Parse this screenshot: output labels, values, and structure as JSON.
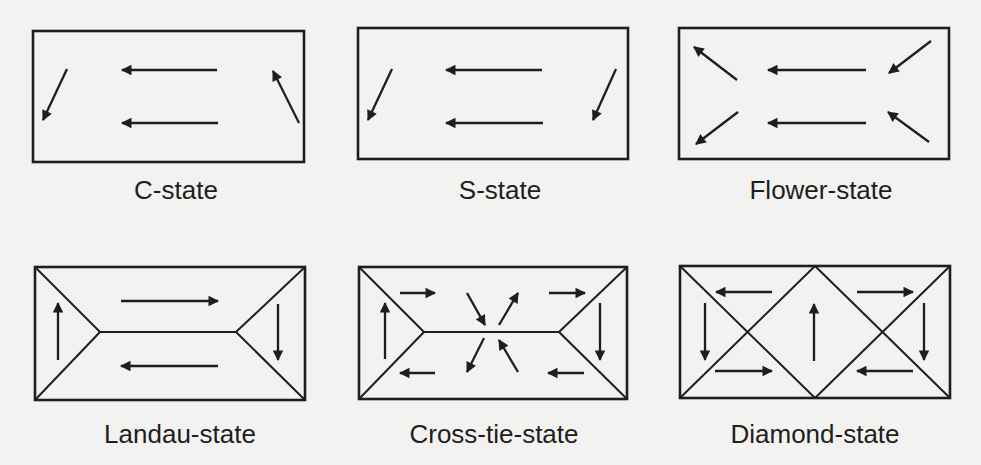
{
  "figure": {
    "colors": {
      "background": "#f2f2f1",
      "ink": "#1e1e1e"
    },
    "panels": [
      {
        "id": "c-state",
        "label": "C-state",
        "rect": [
          33,
          31,
          304,
          162
        ],
        "label_pos": [
          176,
          177
        ],
        "walls": [],
        "arrows": [
          {
            "dir": "down-left",
            "from": [
              67,
              69
            ],
            "to": [
              43,
              120
            ]
          },
          {
            "dir": "left",
            "from": [
              217,
              70
            ],
            "to": [
              122,
              70
            ]
          },
          {
            "dir": "left",
            "from": [
              218,
              123
            ],
            "to": [
              122,
              123
            ]
          },
          {
            "dir": "up-left",
            "from": [
              299,
              123
            ],
            "to": [
              273,
              71
            ]
          }
        ]
      },
      {
        "id": "s-state",
        "label": "S-state",
        "rect": [
          358,
          28,
          628,
          159
        ],
        "label_pos": [
          500,
          177
        ],
        "walls": [],
        "arrows": [
          {
            "dir": "down-left",
            "from": [
              392,
              69
            ],
            "to": [
              368,
              120
            ]
          },
          {
            "dir": "left",
            "from": [
              542,
              70
            ],
            "to": [
              446,
              70
            ]
          },
          {
            "dir": "left",
            "from": [
              543,
              123
            ],
            "to": [
              446,
              123
            ]
          },
          {
            "dir": "down-left",
            "from": [
              616,
              69
            ],
            "to": [
              593,
              120
            ]
          }
        ]
      },
      {
        "id": "flower-state",
        "label": "Flower-state",
        "rect": [
          679,
          28,
          949,
          159
        ],
        "label_pos": [
          821,
          177
        ],
        "walls": [],
        "arrows": [
          {
            "dir": "up-left",
            "from": [
              737,
              80
            ],
            "to": [
              694,
              47
            ]
          },
          {
            "dir": "left",
            "from": [
              866,
              70
            ],
            "to": [
              768,
              70
            ]
          },
          {
            "dir": "down-left",
            "from": [
              931,
              41
            ],
            "to": [
              889,
              73
            ]
          },
          {
            "dir": "down-left",
            "from": [
              738,
              112
            ],
            "to": [
              696,
              144
            ]
          },
          {
            "dir": "left",
            "from": [
              866,
              123
            ],
            "to": [
              768,
              123
            ]
          },
          {
            "dir": "up-left",
            "from": [
              929,
              142
            ],
            "to": [
              888,
              112
            ]
          }
        ]
      },
      {
        "id": "landau-state",
        "label": "Landau-state",
        "rect": [
          35,
          267,
          305,
          400
        ],
        "label_pos": [
          180,
          421
        ],
        "walls": [
          [
            [
              35,
              267
            ],
            [
              100,
              332
            ]
          ],
          [
            [
              35,
              400
            ],
            [
              100,
              332
            ]
          ],
          [
            [
              100,
              332
            ],
            [
              236,
              332
            ]
          ],
          [
            [
              305,
              267
            ],
            [
              236,
              332
            ]
          ],
          [
            [
              305,
              400
            ],
            [
              236,
              332
            ]
          ]
        ],
        "arrows": [
          {
            "dir": "up",
            "from": [
              58,
              360
            ],
            "to": [
              58,
              303
            ]
          },
          {
            "dir": "right",
            "from": [
              121,
              301
            ],
            "to": [
              218,
              301
            ]
          },
          {
            "dir": "down",
            "from": [
              278,
              304
            ],
            "to": [
              278,
              360
            ]
          },
          {
            "dir": "left",
            "from": [
              218,
              366
            ],
            "to": [
              121,
              366
            ]
          }
        ]
      },
      {
        "id": "cross-tie-state",
        "label": "Cross-tie-state",
        "rect": [
          359,
          267,
          627,
          399
        ],
        "label_pos": [
          494,
          421
        ],
        "walls": [
          [
            [
              359,
              267
            ],
            [
              424,
              332
            ]
          ],
          [
            [
              359,
              399
            ],
            [
              424,
              332
            ]
          ],
          [
            [
              424,
              332
            ],
            [
              559,
              332
            ]
          ],
          [
            [
              627,
              267
            ],
            [
              559,
              332
            ]
          ],
          [
            [
              627,
              399
            ],
            [
              559,
              332
            ]
          ]
        ],
        "arrows": [
          {
            "dir": "up",
            "from": [
              385,
              359
            ],
            "to": [
              385,
              303
            ]
          },
          {
            "dir": "right",
            "from": [
              400,
              293
            ],
            "to": [
              435,
              293
            ]
          },
          {
            "dir": "down-right",
            "from": [
              467,
              293
            ],
            "to": [
              485,
              325
            ]
          },
          {
            "dir": "up-right",
            "from": [
              499,
              325
            ],
            "to": [
              518,
              293
            ]
          },
          {
            "dir": "right",
            "from": [
              549,
              293
            ],
            "to": [
              585,
              293
            ]
          },
          {
            "dir": "down",
            "from": [
              600,
              303
            ],
            "to": [
              600,
              360
            ]
          },
          {
            "dir": "left",
            "from": [
              584,
              373
            ],
            "to": [
              548,
              373
            ]
          },
          {
            "dir": "up-left",
            "from": [
              518,
              372
            ],
            "to": [
              499,
              340
            ]
          },
          {
            "dir": "down-left",
            "from": [
              484,
              338
            ],
            "to": [
              467,
              372
            ]
          },
          {
            "dir": "left",
            "from": [
              435,
              373
            ],
            "to": [
              400,
              373
            ]
          }
        ]
      },
      {
        "id": "diamond-state",
        "label": "Diamond-state",
        "rect": [
          680,
          266,
          950,
          398
        ],
        "label_pos": [
          815,
          421
        ],
        "walls": [
          [
            [
              680,
              266
            ],
            [
              815,
              398
            ]
          ],
          [
            [
              680,
              398
            ],
            [
              815,
              266
            ]
          ],
          [
            [
              815,
              266
            ],
            [
              950,
              398
            ]
          ],
          [
            [
              815,
              398
            ],
            [
              950,
              266
            ]
          ]
        ],
        "arrows": [
          {
            "dir": "left",
            "from": [
              772,
              292
            ],
            "to": [
              716,
              292
            ]
          },
          {
            "dir": "down",
            "from": [
              705,
              303
            ],
            "to": [
              705,
              360
            ]
          },
          {
            "dir": "right",
            "from": [
              715,
              371
            ],
            "to": [
              772,
              371
            ]
          },
          {
            "dir": "up",
            "from": [
              814,
              361
            ],
            "to": [
              814,
              304
            ]
          },
          {
            "dir": "right",
            "from": [
              857,
              292
            ],
            "to": [
              913,
              292
            ]
          },
          {
            "dir": "down",
            "from": [
              924,
              303
            ],
            "to": [
              924,
              360
            ]
          },
          {
            "dir": "left",
            "from": [
              913,
              371
            ],
            "to": [
              857,
              371
            ]
          }
        ]
      }
    ]
  }
}
